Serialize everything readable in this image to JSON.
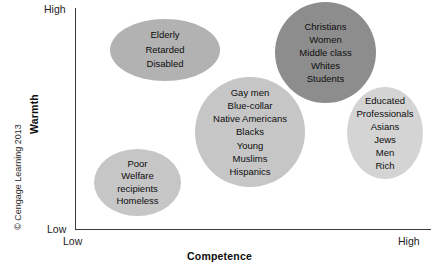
{
  "chart_data": {
    "type": "scatter",
    "title": "",
    "xlabel": "Competence",
    "ylabel": "Warmth",
    "xticklabels": [
      "Low",
      "High"
    ],
    "yticklabels": [
      "Low",
      "High"
    ],
    "xlim": [
      "Low",
      "High"
    ],
    "ylim": [
      "Low",
      "High"
    ],
    "grid": false,
    "legend": "none",
    "credit": "© Cengage Learning 2013",
    "clusters": [
      {
        "id": "elderly",
        "name": "paternalistic-high-warmth-low-competence",
        "x": 0.22,
        "y": 0.88,
        "fill": "#b2b2b2",
        "members": [
          "Elderly",
          "Retarded",
          "Disabled"
        ]
      },
      {
        "id": "admired",
        "name": "admired-high-warmth-high-competence",
        "x": 0.72,
        "y": 0.9,
        "fill": "#8d8d8d",
        "members": [
          "Christians",
          "Women",
          "Middle class",
          "Whites",
          "Students"
        ]
      },
      {
        "id": "ambivalent",
        "name": "mid-warmth-mid-competence",
        "x": 0.51,
        "y": 0.5,
        "fill": "#c6c6c6",
        "members": [
          "Gay men",
          "Blue-collar",
          "Native Americans",
          "Blacks",
          "Young",
          "Muslims",
          "Hispanics"
        ]
      },
      {
        "id": "envied",
        "name": "envied-low-warmth-high-competence",
        "x": 0.9,
        "y": 0.45,
        "fill": "#d4d4d4",
        "members": [
          "Educated",
          "Professionals",
          "Asians",
          "Jews",
          "Men",
          "Rich"
        ]
      },
      {
        "id": "pitied",
        "name": "contemptuous-low-warmth-low-competence",
        "x": 0.12,
        "y": 0.2,
        "fill": "#c6c6c6",
        "members": [
          "Poor",
          "Welfare",
          "recipients",
          "Homeless"
        ]
      }
    ]
  },
  "axes": {
    "x_title": "Competence",
    "y_title": "Warmth",
    "x_low": "Low",
    "x_high": "High",
    "y_low": "Low",
    "y_high": "High"
  },
  "credit": {
    "text": "© Cengage Learning 2013"
  },
  "clusters": {
    "elderly": {
      "line1": "Elderly",
      "line2": "Retarded",
      "line3": "Disabled"
    },
    "admired": {
      "line1": "Christians",
      "line2": "Women",
      "line3": "Middle class",
      "line4": "Whites",
      "line5": "Students"
    },
    "ambivalent": {
      "line1": "Gay men",
      "line2": "Blue-collar",
      "line3": "Native Americans",
      "line4": "Blacks",
      "line5": "Young",
      "line6": "Muslims",
      "line7": "Hispanics"
    },
    "envied": {
      "line1": "Educated",
      "line2": "Professionals",
      "line3": "Asians",
      "line4": "Jews",
      "line5": "Men",
      "line6": "Rich"
    },
    "pitied": {
      "line1": "Poor",
      "line2": "Welfare",
      "line3": "recipients",
      "line4": "Homeless"
    }
  }
}
